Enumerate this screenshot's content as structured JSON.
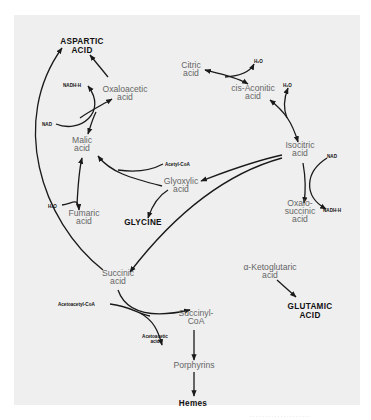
{
  "diagram": {
    "background": "#efefef",
    "nodes": {
      "aspartic_acid": {
        "line1": "ASPARTIC",
        "line2": "ACID"
      },
      "oxaloacetic_acid": {
        "line1": "Oxaloacetic",
        "line2": "acid"
      },
      "citric_acid": {
        "line1": "Citric",
        "line2": "acid"
      },
      "cis_aconitic_acid": {
        "line1": "cis-Aconitic",
        "line2": "acid"
      },
      "isocitric_acid": {
        "line1": "Isocitric",
        "line2": "acid"
      },
      "malic_acid": {
        "line1": "Malic",
        "line2": "acid"
      },
      "fumaric_acid": {
        "line1": "Fumaric",
        "line2": "acid"
      },
      "glyoxylic_acid": {
        "line1": "Glyoxylic",
        "line2": "acid"
      },
      "glycine": {
        "line1": "GLYCINE"
      },
      "oxalosuccinic_acid": {
        "line1": "Oxalo-",
        "line2": "succinic",
        "line3": "acid"
      },
      "succinic_acid": {
        "line1": "Succinic",
        "line2": "acid"
      },
      "alpha_ketoglutaric_acid": {
        "line1": "α-Ketoglutaric",
        "line2": "acid"
      },
      "glutamic_acid": {
        "line1": "GLUTAMIC",
        "line2": "ACID"
      },
      "succinyl_coa": {
        "line1": "Succinyl-",
        "line2": "CoA"
      },
      "porphyrins": {
        "line1": "Porphyrins"
      },
      "hemes": {
        "line1": "Hemes"
      }
    },
    "cofactors": {
      "nadh_top": "NADH·H",
      "nad_left": "NAD",
      "h2o_citric": "H₂O",
      "h2o_aconitic": "H₂O",
      "nad_right": "NAD",
      "nadh_right": "NADH·H",
      "acetyl_coa": "Acetyl-CoA",
      "h2o_fumaric": "H₂O",
      "acetoacetyl_coa": "Acetoacetyl-CoA",
      "acetoacetic_acid_1": "Acetoacetic",
      "acetoacetic_acid_2": "acid"
    },
    "caption": "· · · · · · · · · · · · · · · · · · · ·"
  }
}
